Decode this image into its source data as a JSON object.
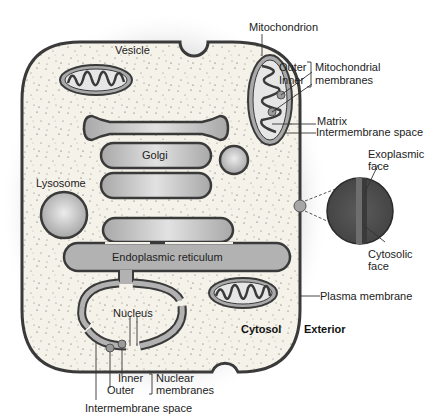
{
  "diagram": {
    "colors": {
      "cell_fill": "#f4f1ea",
      "outline": "#3a3a3a",
      "organelle_fill": "#b8b8b8",
      "organelle_highlight": "#e6e6e6",
      "bilayer_dark": "#4a4a4a",
      "bilayer_mid": "#6a6a6a",
      "shadow": "#9a9a9a"
    },
    "labels": {
      "vesicle": "Vesicle",
      "mitochondrion": "Mitochondrion",
      "mito_outer": "Outer",
      "mito_inner": "Inner",
      "mito_membranes_1": "Mitochondrial",
      "mito_membranes_2": "membranes",
      "matrix": "Matrix",
      "mito_intermembrane": "Intermembrane space",
      "golgi": "Golgi",
      "lysosome": "Lysosome",
      "exoplasmic_1": "Exoplasmic",
      "exoplasmic_2": "face",
      "cytosolic_1": "Cytosolic",
      "cytosolic_2": "face",
      "er": "Endoplasmic reticulum",
      "nucleus": "Nucleus",
      "plasma_membrane": "Plasma membrane",
      "cytosol": "Cytosol",
      "exterior": "Exterior",
      "nuc_inner": "Inner",
      "nuc_outer": "Outer",
      "nuc_membranes_1": "Nuclear",
      "nuc_membranes_2": "membranes",
      "nuc_intermembrane": "Intermembrane space"
    }
  }
}
